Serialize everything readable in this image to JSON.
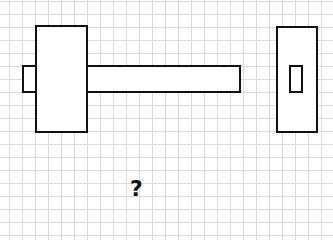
{
  "diagram": {
    "type": "orthographic-projection",
    "grid": {
      "spacing_px": 13,
      "color": "#dcdcdc"
    },
    "front_view": {
      "left_tab": {
        "x": 22,
        "y": 65,
        "w": 15,
        "h": 28
      },
      "main_block": {
        "x": 35,
        "y": 25,
        "w": 53,
        "h": 108
      },
      "bar": {
        "x": 86,
        "y": 65,
        "w": 155,
        "h": 28
      }
    },
    "side_view": {
      "outer_block": {
        "x": 276,
        "y": 26,
        "w": 42,
        "h": 107
      },
      "inner_square": {
        "x": 289,
        "y": 65,
        "w": 14,
        "h": 28
      }
    },
    "missing_view_label": "?"
  }
}
